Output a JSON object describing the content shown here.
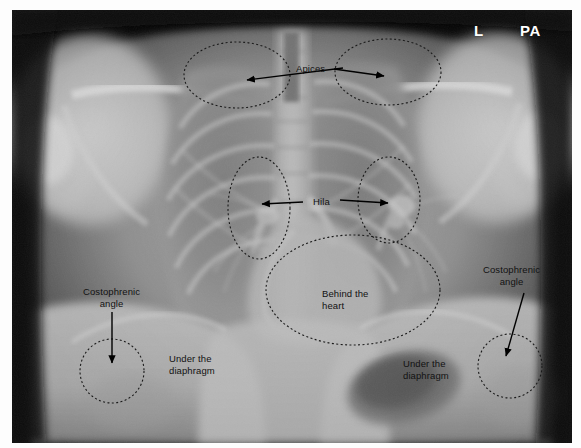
{
  "image": {
    "modality_title": "PA chest radiograph",
    "frame": {
      "x": 12,
      "y": 10,
      "width": 560,
      "height": 433
    },
    "background_color": "#000000"
  },
  "orientation_markers": [
    {
      "name": "side-marker",
      "text": "L",
      "x": 474,
      "y": 22,
      "color": "#ffffff"
    },
    {
      "name": "projection-marker",
      "text": "PA",
      "x": 520,
      "y": 22,
      "color": "#ffffff"
    }
  ],
  "annotations": [
    {
      "id": "apices",
      "label": "Apices",
      "label_x": 296,
      "label_y": 63,
      "align": "center",
      "regions": [
        {
          "shape": "ellipse",
          "cx": 237,
          "cy": 75,
          "rx": 53,
          "ry": 33
        },
        {
          "shape": "ellipse",
          "cx": 388,
          "cy": 72,
          "rx": 53,
          "ry": 33
        }
      ],
      "arrows": [
        {
          "x1": 343,
          "y1": 68,
          "x2": 247,
          "y2": 80
        },
        {
          "x1": 334,
          "y1": 69,
          "x2": 384,
          "y2": 76
        }
      ]
    },
    {
      "id": "hila",
      "label": "Hila",
      "label_x": 313,
      "label_y": 196,
      "align": "center",
      "regions": [
        {
          "shape": "ellipse",
          "cx": 259,
          "cy": 208,
          "rx": 31,
          "ry": 51
        },
        {
          "shape": "ellipse",
          "cx": 389,
          "cy": 200,
          "rx": 31,
          "ry": 43
        }
      ],
      "arrows": [
        {
          "x1": 303,
          "y1": 202,
          "x2": 262,
          "y2": 204
        },
        {
          "x1": 340,
          "y1": 200,
          "x2": 388,
          "y2": 203
        }
      ]
    },
    {
      "id": "behind-the-heart",
      "label": "Behind the\nheart",
      "label_x": 322,
      "label_y": 288,
      "align": "left",
      "regions": [
        {
          "shape": "ellipse",
          "cx": 353,
          "cy": 290,
          "rx": 87,
          "ry": 55
        }
      ],
      "arrows": []
    },
    {
      "id": "costophrenic-angle-right",
      "label": "Costophrenic\nangle",
      "label_x": 83,
      "label_y": 286,
      "align": "center",
      "regions": [
        {
          "shape": "circle",
          "cx": 112,
          "cy": 371,
          "r": 32
        }
      ],
      "arrows": [
        {
          "x1": 112,
          "y1": 312,
          "x2": 112,
          "y2": 363
        }
      ]
    },
    {
      "id": "costophrenic-angle-left",
      "label": "Costophrenic\nangle",
      "label_x": 483,
      "label_y": 264,
      "align": "center",
      "regions": [
        {
          "shape": "circle",
          "cx": 510,
          "cy": 366,
          "r": 32
        }
      ],
      "arrows": [
        {
          "x1": 524,
          "y1": 293,
          "x2": 506,
          "y2": 356
        }
      ]
    },
    {
      "id": "under-the-diaphragm-right",
      "label": "Under the\ndiaphragm",
      "label_x": 169,
      "label_y": 353,
      "align": "left",
      "regions": [],
      "arrows": []
    },
    {
      "id": "under-the-diaphragm-left",
      "label": "Under the\ndiaphragm",
      "label_x": 403,
      "label_y": 358,
      "align": "left",
      "regions": [],
      "arrows": []
    }
  ],
  "style": {
    "region_stroke": "#1a1a1a",
    "region_dash": "2,2.4",
    "region_stroke_width": 1.1,
    "arrow_color": "#000000",
    "label_color": "#121212",
    "label_font_size_px": 9.5
  }
}
